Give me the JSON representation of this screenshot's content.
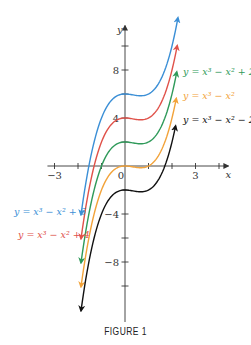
{
  "chart_data": {
    "type": "line",
    "title": "",
    "caption": "FIGURE 1",
    "xlabel": "x",
    "ylabel": "y",
    "x_ticks": [
      -3,
      -2,
      -1,
      0,
      1,
      2,
      3,
      4
    ],
    "x_tick_labels": [
      {
        "value": -3,
        "label": "−3"
      },
      {
        "value": 0,
        "label": "0"
      },
      {
        "value": 3,
        "label": "3"
      }
    ],
    "y_ticks": [
      -10,
      -8,
      -6,
      -4,
      -2,
      2,
      4,
      6,
      8,
      10
    ],
    "y_tick_labels": [
      {
        "value": 8,
        "label": "8"
      },
      {
        "value": 4,
        "label": "4"
      },
      {
        "value": -4,
        "label": "−4"
      },
      {
        "value": -8,
        "label": "−8"
      }
    ],
    "xlim": [
      -3.3,
      4.4
    ],
    "ylim": [
      -13,
      11.7
    ],
    "grid": false,
    "series": [
      {
        "name": "y = x³ − x² + 6",
        "c": 6,
        "color": "#3b8fd6",
        "x_range": [
          -1.87,
          2.25
        ],
        "label": "y = x³ − x² + 6",
        "label_pos": [
          14,
          215
        ]
      },
      {
        "name": "y = x³ − x² + 4",
        "c": 4,
        "color": "#e0524a",
        "x_range": [
          -1.87,
          2.22
        ],
        "label": "y = x³ − x² + 4",
        "label_pos": [
          18,
          238
        ]
      },
      {
        "name": "y = x³ − x² + 2",
        "c": 2,
        "color": "#2f9a5a",
        "x_range": [
          -1.87,
          2.2
        ],
        "label": "y = x³ − x² + 2",
        "label_pos": [
          183,
          75
        ]
      },
      {
        "name": "y = x³ − x²",
        "c": 0,
        "color": "#f2a33a",
        "x_range": [
          -1.87,
          2.18
        ],
        "label": "y = x³ − x²",
        "label_pos": [
          183,
          99
        ]
      },
      {
        "name": "y = x³ − x² − 2",
        "c": -2,
        "color": "#111111",
        "x_range": [
          -1.87,
          2.15
        ],
        "label": "y = x³ − x² − 2",
        "label_pos": [
          183,
          123
        ]
      }
    ]
  }
}
